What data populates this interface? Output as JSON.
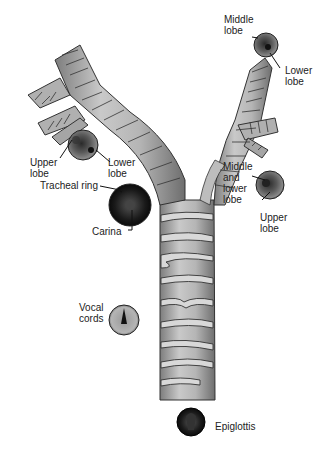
{
  "diagram": {
    "type": "anatomical illustration",
    "colors": {
      "airway_fill": "#a9a9a9",
      "airway_light": "#cfcfcf",
      "outline": "#333333",
      "view_dark": "#1a1a1a",
      "view_mid": "#555555"
    }
  },
  "labels": {
    "left_upper_lobe": [
      "Upper",
      "lobe"
    ],
    "left_lower_lobe": [
      "Lower",
      "lobe"
    ],
    "tracheal_ring": "Tracheal ring",
    "carina": "Carina",
    "right_middle_lobe_top": [
      "Middle",
      "lobe"
    ],
    "right_lower_lobe_top": [
      "Lower",
      "lobe"
    ],
    "right_middle_lower_lobe": [
      "Middle",
      "and",
      "lower",
      "lobe"
    ],
    "right_upper_lobe": [
      "Upper",
      "lobe"
    ],
    "vocal_cords": [
      "Vocal",
      "cords"
    ],
    "epiglottis": "Epiglottis"
  }
}
